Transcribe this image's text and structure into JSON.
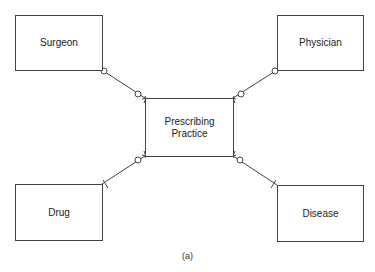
{
  "diagram": {
    "type": "entity-relationship",
    "caption": "(a)",
    "entities": [
      {
        "id": "surgeon",
        "label": "Surgeon"
      },
      {
        "id": "physician",
        "label": "Physician"
      },
      {
        "id": "prescribing_practice",
        "label_line1": "Prescribing",
        "label_line2": "Practice"
      },
      {
        "id": "drug",
        "label": "Drug"
      },
      {
        "id": "disease",
        "label": "Disease"
      }
    ],
    "relationships": [
      {
        "from": "surgeon",
        "to": "prescribing_practice",
        "from_end": "zero-or-one",
        "to_end": "zero-or-many"
      },
      {
        "from": "physician",
        "to": "prescribing_practice",
        "from_end": "zero-or-one",
        "to_end": "zero-or-many"
      },
      {
        "from": "drug",
        "to": "prescribing_practice",
        "from_end": "exactly-one",
        "to_end": "zero-or-many"
      },
      {
        "from": "disease",
        "to": "prescribing_practice",
        "from_end": "exactly-one",
        "to_end": "zero-or-many"
      }
    ]
  }
}
